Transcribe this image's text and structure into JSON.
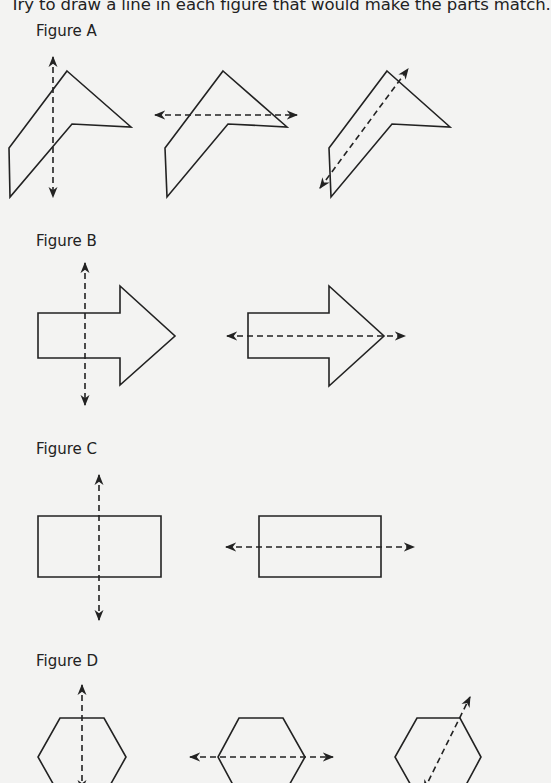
{
  "instruction": "Try to draw a line in each figure that would make the parts match.",
  "figures": [
    {
      "label": "Figure A",
      "shapes": [
        {
          "type": "chevron",
          "points": "67,71 131,127 72,124 10,197 9,148",
          "line": {
            "x1": 53,
            "y1": 57,
            "x2": 53,
            "y2": 197
          },
          "line_orientation": "vertical"
        },
        {
          "type": "chevron",
          "points": "223,71 287,127 228,124 167,197 165,148",
          "line": {
            "x1": 155,
            "y1": 115,
            "x2": 297,
            "y2": 115
          },
          "line_orientation": "horizontal"
        },
        {
          "type": "chevron",
          "points": "387,71 450,127 392,124 331,197 329,148",
          "line": {
            "x1": 320,
            "y1": 188,
            "x2": 408,
            "y2": 69
          },
          "line_orientation": "diagonal"
        }
      ]
    },
    {
      "label": "Figure B",
      "shapes": [
        {
          "type": "arrow",
          "points": "38,313 120,313 120,286 175,336 120,385 120,358 38,358",
          "line": {
            "x1": 85,
            "y1": 263,
            "x2": 85,
            "y2": 405
          },
          "line_orientation": "vertical"
        },
        {
          "type": "arrow",
          "points": "248,313 329,313 329,286 384,336 329,386 329,358 248,358",
          "line": {
            "x1": 227,
            "y1": 336,
            "x2": 405,
            "y2": 336
          },
          "line_orientation": "horizontal"
        }
      ]
    },
    {
      "label": "Figure C",
      "shapes": [
        {
          "type": "rectangle",
          "points": "38,516 161,516 161,577 38,577",
          "line": {
            "x1": 99,
            "y1": 475,
            "x2": 99,
            "y2": 620
          },
          "line_orientation": "vertical"
        },
        {
          "type": "rectangle",
          "points": "259,516 381,516 381,577 259,577",
          "line": {
            "x1": 226,
            "y1": 547,
            "x2": 414,
            "y2": 547
          },
          "line_orientation": "horizontal"
        }
      ]
    },
    {
      "label": "Figure D",
      "shapes": [
        {
          "type": "hexagon",
          "points": "60,718 104,718 126,757 104,796 60,796 38,757",
          "line": {
            "x1": 82,
            "y1": 685,
            "x2": 82,
            "y2": 790
          },
          "line_orientation": "vertical"
        },
        {
          "type": "hexagon",
          "points": "239,718 283,718 305,757 283,796 239,796 218,757",
          "line": {
            "x1": 190,
            "y1": 757,
            "x2": 333,
            "y2": 757
          },
          "line_orientation": "horizontal"
        },
        {
          "type": "hexagon",
          "points": "417,718 460,718 481,757 460,796 417,796 395,757",
          "line": {
            "x1": 424,
            "y1": 790,
            "x2": 470,
            "y2": 697
          },
          "line_orientation": "diagonal"
        }
      ]
    }
  ],
  "colors": {
    "background": "#f3f3f2",
    "ink": "#222222"
  }
}
